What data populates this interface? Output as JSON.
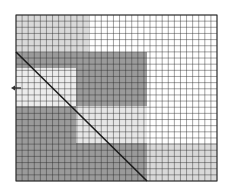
{
  "diagram": {
    "grid": {
      "left": 16,
      "top": 15,
      "right": 217,
      "bottom": 181,
      "cols": 33,
      "rows": 27,
      "line_color": "#2a2a2a",
      "background": "#ffffff"
    },
    "regions": [
      {
        "name": "top-left-light-region",
        "x": 16,
        "y": 15,
        "w": 72,
        "h": 37,
        "color": "#d9d9d9"
      },
      {
        "name": "upper-dark-band",
        "x": 16,
        "y": 52,
        "w": 131,
        "h": 16,
        "color": "#9a9a9a"
      },
      {
        "name": "center-dark-block",
        "x": 76,
        "y": 68,
        "w": 71,
        "h": 38,
        "color": "#9a9a9a"
      },
      {
        "name": "left-light-band",
        "x": 16,
        "y": 68,
        "w": 60,
        "h": 38,
        "color": "#ececec"
      },
      {
        "name": "lower-left-dark-block",
        "x": 16,
        "y": 106,
        "w": 60,
        "h": 37,
        "color": "#9a9a9a"
      },
      {
        "name": "center-light-block",
        "x": 76,
        "y": 106,
        "w": 71,
        "h": 37,
        "color": "#e6e6e6"
      },
      {
        "name": "bottom-dark-band",
        "x": 16,
        "y": 143,
        "w": 131,
        "h": 38,
        "color": "#9a9a9a"
      },
      {
        "name": "bottom-right-light-region",
        "x": 147,
        "y": 143,
        "w": 70,
        "h": 38,
        "color": "#d9d9d9"
      }
    ],
    "diagonal": {
      "x1": 16,
      "y1": 52,
      "x2": 147,
      "y2": 181,
      "color": "#1a1a1a",
      "width": 1.6
    },
    "arrow": {
      "direction": "left",
      "x": 11,
      "y": 88,
      "length": 10,
      "color": "#333333"
    }
  }
}
